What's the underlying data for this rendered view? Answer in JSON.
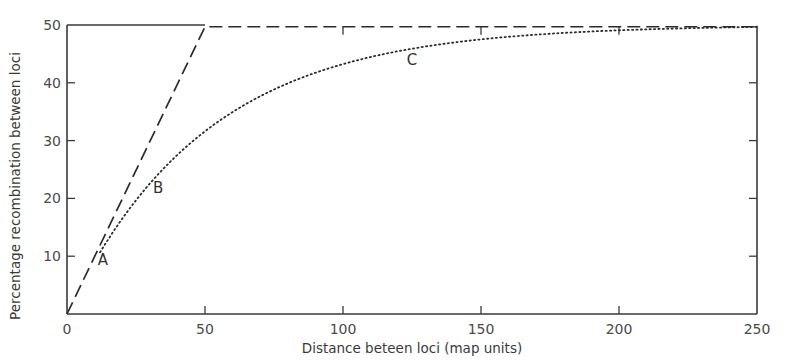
{
  "chart_data": {
    "type": "line",
    "title": "",
    "xlabel": "Distance beteen loci (map units)",
    "ylabel": "Percentage recombination between loci",
    "xlim": [
      0,
      250
    ],
    "ylim": [
      0,
      50
    ],
    "x_ticks": [
      0,
      50,
      100,
      150,
      200,
      250
    ],
    "x_tick_labels": [
      "0",
      "50",
      "100",
      "150",
      "200",
      "250"
    ],
    "y_ticks": [
      10,
      20,
      30,
      40,
      50
    ],
    "y_tick_labels": [
      "10",
      "20",
      "30",
      "40",
      "50"
    ],
    "grid": false,
    "legend": null,
    "series": [
      {
        "name": "Linear (dashed)",
        "style": "dashed",
        "x": [
          0,
          50,
          250
        ],
        "y": [
          0,
          49.7,
          49.7
        ]
      },
      {
        "name": "Mapping function (dotted)",
        "style": "dotted",
        "x": [
          12,
          20,
          30,
          40,
          50,
          60,
          70,
          80,
          90,
          100,
          120,
          140,
          160,
          180,
          200,
          220,
          250
        ],
        "y": [
          10.7,
          16.5,
          22.6,
          27.5,
          31.6,
          34.9,
          37.7,
          39.9,
          41.7,
          43.2,
          45.5,
          46.9,
          48.0,
          48.6,
          49.1,
          49.4,
          49.7
        ]
      }
    ],
    "annotations": [
      {
        "text": "A",
        "x": 13,
        "y": 8.5
      },
      {
        "text": "B",
        "x": 33,
        "y": 21
      },
      {
        "text": "C",
        "x": 125,
        "y": 43
      }
    ],
    "colors": {
      "line": "#2b2b2b",
      "axis": "#3a3a3a",
      "text": "#4a4a4a"
    }
  }
}
